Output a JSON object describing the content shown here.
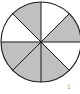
{
  "diagram": {
    "type": "fraction-circle",
    "center": [
      41,
      42
    ],
    "radius": 40,
    "sector_count": 8,
    "colors": {
      "shaded": "#c0c0c0",
      "unshaded": "#ffffff",
      "stroke": "#1a1a1a"
    },
    "sectors": [
      {
        "index": 0,
        "start_deg": 0,
        "end_deg": 45,
        "shaded": false
      },
      {
        "index": 1,
        "start_deg": 45,
        "end_deg": 90,
        "shaded": true
      },
      {
        "index": 2,
        "start_deg": 90,
        "end_deg": 135,
        "shaded": false
      },
      {
        "index": 3,
        "start_deg": 135,
        "end_deg": 180,
        "shaded": true
      },
      {
        "index": 4,
        "start_deg": 180,
        "end_deg": 225,
        "shaded": true
      },
      {
        "index": 5,
        "start_deg": 225,
        "end_deg": 270,
        "shaded": true
      },
      {
        "index": 6,
        "start_deg": 270,
        "end_deg": 315,
        "shaded": false
      },
      {
        "index": 7,
        "start_deg": 315,
        "end_deg": 360,
        "shaded": true
      }
    ],
    "shaded_count": 5,
    "mark_label": "1"
  }
}
